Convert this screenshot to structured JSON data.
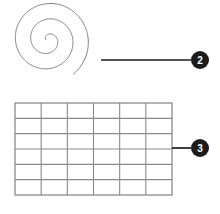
{
  "figure": {
    "background_color": "#ffffff",
    "callouts": [
      {
        "id": "callout-2",
        "number": "2",
        "target": "spiral",
        "badge": {
          "cx": 200,
          "cy": 60,
          "r": 9,
          "fill": "#1c1c1c",
          "text_color": "#ffffff"
        },
        "leader": {
          "x1": 101,
          "y1": 60,
          "x2": 191,
          "y2": 60,
          "color": "#1c1c1c",
          "width": 1.7
        }
      },
      {
        "id": "callout-3",
        "number": "3",
        "target": "grid",
        "badge": {
          "cx": 200,
          "cy": 148,
          "r": 9,
          "fill": "#1c1c1c",
          "text_color": "#ffffff"
        },
        "leader": {
          "x1": 172,
          "y1": 148,
          "x2": 191,
          "y2": 148,
          "color": "#1c1c1c",
          "width": 1.7
        }
      }
    ],
    "spiral": {
      "name": "spiral-curve",
      "center_x": 48,
      "center_y": 40,
      "start_radius": 2.2,
      "growth": 2.45,
      "turns": 2.62,
      "start_angle_deg": 170,
      "stroke_color": "#6f6f6f",
      "stroke_width": 0.9,
      "bounds": {
        "x": 18,
        "y": 13,
        "width": 88,
        "height": 78
      }
    },
    "grid": {
      "name": "grid-mesh",
      "x": 15,
      "y": 103,
      "width": 157,
      "height": 92,
      "columns": 6,
      "rows": 6,
      "line_color": "#8a8a8a",
      "line_width": 1.1,
      "border_color": "#8a8a8a",
      "border_width": 1.3,
      "fill": "#ffffff"
    }
  }
}
